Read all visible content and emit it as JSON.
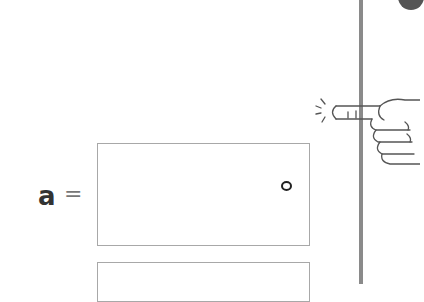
{
  "equation": {
    "variable": "a",
    "equals": "=",
    "answer_box_mark": "°"
  },
  "colors": {
    "divider": "#8a8a8a",
    "box_border": "#a8a8a8",
    "text": "#333333"
  },
  "icons": [
    "pointing-hand-icon",
    "corner-circle-icon"
  ]
}
